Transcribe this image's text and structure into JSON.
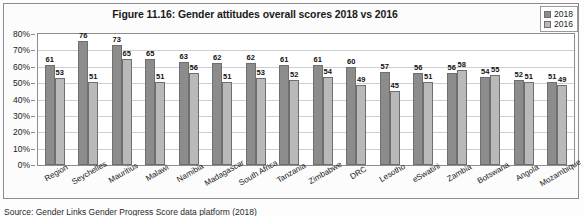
{
  "figure": {
    "title": "Figure 11.16: Gender attitudes overall scores 2018 vs 2016",
    "source": "Source: Gender Links Gender Progress Score data platform (2018)"
  },
  "legend": {
    "items": [
      {
        "label": "2018",
        "color": "#8c8c8c"
      },
      {
        "label": "2016",
        "color": "#b9b9b9"
      }
    ]
  },
  "yaxis": {
    "ticks": [
      "80%",
      "70%",
      "60%",
      "50%",
      "40%",
      "30%",
      "20%",
      "10%",
      "0%"
    ]
  },
  "chart_data": {
    "type": "bar",
    "title": "Figure 11.16: Gender attitudes overall scores 2018 vs 2016",
    "xlabel": "",
    "ylabel": "",
    "ylim": [
      0,
      80
    ],
    "ytick_step": 10,
    "ytick_format": "percent",
    "grid": true,
    "legend_position": "top-right",
    "categories": [
      "Region",
      "Seychelles",
      "Mauritius",
      "Malawi",
      "Namibia",
      "Madagascar",
      "South Africa",
      "Tanzania",
      "Zimbabwe",
      "DRC",
      "Lesotho",
      "eSwatini",
      "Zambia",
      "Botswana",
      "Angola",
      "Mozambique"
    ],
    "series": [
      {
        "name": "2018",
        "color": "#8c8c8c",
        "values": [
          61,
          76,
          73,
          65,
          63,
          62,
          62,
          61,
          61,
          60,
          57,
          56,
          56,
          54,
          52,
          51
        ]
      },
      {
        "name": "2016",
        "color": "#b9b9b9",
        "values": [
          53,
          51,
          65,
          51,
          56,
          51,
          53,
          52,
          54,
          49,
          45,
          51,
          58,
          55,
          51,
          49
        ]
      }
    ]
  }
}
